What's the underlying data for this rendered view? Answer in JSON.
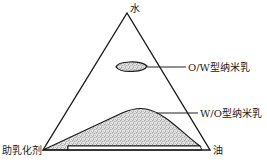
{
  "diagram": {
    "type": "ternary-phase-diagram",
    "vertices": {
      "top": "水",
      "bottom_left": "助乳化剂",
      "bottom_right": "油"
    },
    "regions": [
      {
        "id": "ow",
        "label": "O/W型纳米乳"
      },
      {
        "id": "wo",
        "label": "W/O型纳米乳"
      }
    ],
    "colors": {
      "line": "#1a1a1a",
      "stipple_dot": "#555555",
      "stipple_bg": "#e6e6e6",
      "background": "#ffffff"
    }
  }
}
